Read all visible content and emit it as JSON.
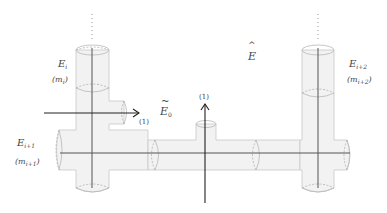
{
  "diagram": {
    "labels": {
      "E_i": {
        "base": "E",
        "sub": "i"
      },
      "m_i": {
        "text": "(m",
        "sub": "i",
        "close": ")"
      },
      "E_i1": {
        "base": "E",
        "sub": "i+1"
      },
      "m_i1": {
        "text": "(m",
        "sub": "i+1",
        "close": ")"
      },
      "E_i2": {
        "base": "E",
        "sub": "i+2"
      },
      "m_i2": {
        "text": "(m",
        "sub": "i+2",
        "close": ")"
      },
      "E_hat": {
        "base": "E",
        "accent": "^"
      },
      "E0_tilde": {
        "base": "E",
        "sub": "0",
        "accent": "~"
      },
      "arrow_left_label": "(1)",
      "arrow_up_label": "(1)"
    },
    "ellipsis": "⋮",
    "colors": {
      "pipe_fill": "#f2f2f2",
      "pipe_stroke": "#c8c8c8",
      "axis": "#555555",
      "arrow": "#222222"
    }
  }
}
